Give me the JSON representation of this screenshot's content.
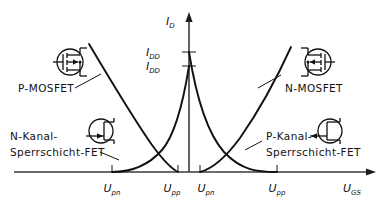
{
  "figure": {
    "type": "transfer-characteristic-diagram"
  },
  "axes": {
    "y_label_main": "I",
    "y_label_sub": "D",
    "x_label_main": "U",
    "x_label_sub": "GS",
    "y_ticks": [
      {
        "main": "I",
        "sub": "DD",
        "y_px": 52
      },
      {
        "main": "I",
        "sub": "DD",
        "y_px": 66
      }
    ],
    "x_ticks": [
      {
        "main": "U",
        "sub": "pn",
        "x_px": 112
      },
      {
        "main": "U",
        "sub": "pp",
        "x_px": 178
      },
      {
        "main": "U",
        "sub": "pn",
        "x_px": 200
      },
      {
        "main": "U",
        "sub": "pp",
        "x_px": 277
      }
    ],
    "origin_x_px": 189,
    "baseline_y_px": 172,
    "axis_color": "#3b3b3b"
  },
  "curves": [
    {
      "name": "p-mosfet-curve",
      "note": "descending parabola, left",
      "color": "#111111"
    },
    {
      "name": "n-mosfet-curve",
      "note": "ascending parabola, right",
      "color": "#111111"
    },
    {
      "name": "n-channel-jfet-curve",
      "note": "parabola rising to right of U_pp left",
      "color": "#111111"
    },
    {
      "name": "p-channel-jfet-curve",
      "note": "parabola falling to U_pp right",
      "color": "#111111"
    }
  ],
  "labels": {
    "p_mosfet": "P-MOSFET",
    "n_mosfet": "N-MOSFET",
    "n_kanal_line1": "N-Kanal-",
    "n_kanal_line2": "Sperrschicht-FET",
    "p_kanal_line1": "P-Kanal-",
    "p_kanal_line2": "Sperrschicht-FET"
  },
  "symbols": {
    "p_mosfet_symbol": "mosfet-symbol-p",
    "n_mosfet_symbol": "mosfet-symbol-n",
    "n_jfet_symbol": "jfet-symbol-n",
    "p_jfet_symbol": "jfet-symbol-p"
  },
  "colors": {
    "ink": "#111111",
    "axis": "#3b3b3b",
    "background": "#ffffff"
  }
}
